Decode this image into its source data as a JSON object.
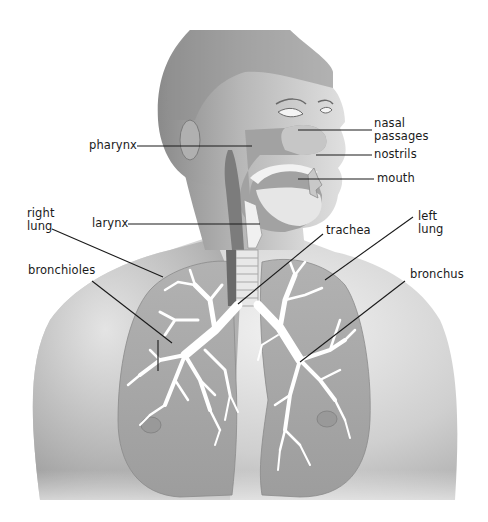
{
  "diagram": {
    "labels": {
      "pharynx": "pharynx",
      "nasal_passages": "nasal\npassages",
      "nostrils": "nostrils",
      "mouth": "mouth",
      "right_lung": "right\nlung",
      "larynx": "larynx",
      "trachea": "trachea",
      "left_lung": "left\nlung",
      "bronchioles": "bronchioles",
      "bronchus": "bronchus"
    },
    "colors": {
      "skin_light": "#e6e6e6",
      "skin_mid": "#bdbdbd",
      "skin_dark": "#8e8e8e",
      "airway": "#9a9a9a",
      "lung": "#a8a8a8",
      "bronchial_tree": "#ffffff",
      "leader_line": "#1a1a1a"
    }
  }
}
